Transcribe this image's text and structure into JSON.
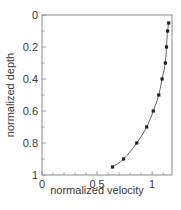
{
  "chart_data": {
    "type": "line",
    "title": "",
    "xlabel": "normalized velocity",
    "ylabel": "normalized depth",
    "xlim": [
      0,
      1.18
    ],
    "ylim": [
      1,
      0
    ],
    "y_inverted": true,
    "grid": false,
    "legend": null,
    "x_ticks": [
      {
        "value": 0,
        "label": "0"
      },
      {
        "value": 0.5,
        "label": "0.5"
      },
      {
        "value": 1,
        "label": "1"
      }
    ],
    "y_ticks": [
      {
        "value": 0,
        "label": "0"
      },
      {
        "value": 0.2,
        "label": "0.2"
      },
      {
        "value": 0.4,
        "label": "0.4"
      },
      {
        "value": 0.6,
        "label": "0.6"
      },
      {
        "value": 0.8,
        "label": "0.8"
      },
      {
        "value": 1,
        "label": "1"
      }
    ],
    "minor_tick_step": 0.1,
    "series": [
      {
        "name": "velocity profile",
        "marker": "square",
        "color": "#222222",
        "line_color": "#555555",
        "points": [
          {
            "x": 1.15,
            "y": 0.05
          },
          {
            "x": 1.14,
            "y": 0.1
          },
          {
            "x": 1.13,
            "y": 0.2
          },
          {
            "x": 1.12,
            "y": 0.3
          },
          {
            "x": 1.09,
            "y": 0.4
          },
          {
            "x": 1.06,
            "y": 0.5
          },
          {
            "x": 1.01,
            "y": 0.6
          },
          {
            "x": 0.95,
            "y": 0.7
          },
          {
            "x": 0.86,
            "y": 0.8
          },
          {
            "x": 0.74,
            "y": 0.9
          },
          {
            "x": 0.64,
            "y": 0.95
          }
        ]
      }
    ]
  },
  "colors": {
    "axis": "#8a8a8a",
    "text": "#3a3a3a"
  }
}
